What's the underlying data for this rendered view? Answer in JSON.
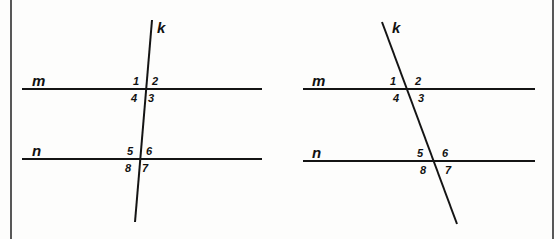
{
  "page": {
    "width": 560,
    "height": 239,
    "background_color": "#fdfdfc",
    "ink_color": "#141414",
    "border_color": "#3a3a3a"
  },
  "borders": {
    "left": {
      "x": 11,
      "y1": 0,
      "y2": 239
    },
    "right": {
      "x": 553,
      "y1": 0,
      "y2": 239
    }
  },
  "figures": [
    {
      "id": "figure-left",
      "name": "near-vertical-transversal",
      "parallel_lines": [
        {
          "label": "m",
          "y": 89,
          "x1": 22,
          "x2": 262,
          "label_x": 32,
          "label_y": 73
        },
        {
          "label": "n",
          "y": 159,
          "x1": 22,
          "x2": 262,
          "label_x": 32,
          "label_y": 143
        }
      ],
      "transversal": {
        "label": "k",
        "x1": 152,
        "y1": 20,
        "x2": 135,
        "y2": 222,
        "label_x": 157,
        "label_y": 20
      },
      "intersections": [
        {
          "line": "m",
          "x": 146,
          "y": 89
        },
        {
          "line": "n",
          "x": 140,
          "y": 159
        }
      ],
      "angles": [
        {
          "number": "1",
          "x": 133,
          "y": 76,
          "position": "upper-left",
          "at": "m"
        },
        {
          "number": "2",
          "x": 152,
          "y": 76,
          "position": "upper-right",
          "at": "m"
        },
        {
          "number": "4",
          "x": 131,
          "y": 93,
          "position": "lower-left",
          "at": "m"
        },
        {
          "number": "3",
          "x": 148,
          "y": 93,
          "position": "lower-right",
          "at": "m"
        },
        {
          "number": "5",
          "x": 127,
          "y": 146,
          "position": "upper-left",
          "at": "n"
        },
        {
          "number": "6",
          "x": 146,
          "y": 146,
          "position": "upper-right",
          "at": "n"
        },
        {
          "number": "8",
          "x": 125,
          "y": 163,
          "position": "lower-left",
          "at": "n"
        },
        {
          "number": "7",
          "x": 142,
          "y": 163,
          "position": "lower-right",
          "at": "n"
        }
      ]
    },
    {
      "id": "figure-right",
      "name": "slanted-transversal",
      "parallel_lines": [
        {
          "label": "m",
          "y": 89,
          "x1": 303,
          "x2": 535,
          "label_x": 312,
          "label_y": 73
        },
        {
          "label": "n",
          "y": 161,
          "x1": 303,
          "x2": 535,
          "label_x": 312,
          "label_y": 145
        }
      ],
      "transversal": {
        "label": "k",
        "x1": 382,
        "y1": 22,
        "x2": 457,
        "y2": 224,
        "label_x": 392,
        "label_y": 20
      },
      "intersections": [
        {
          "line": "m",
          "x": 407,
          "y": 89
        },
        {
          "line": "n",
          "x": 434,
          "y": 161
        }
      ],
      "angles": [
        {
          "number": "1",
          "x": 390,
          "y": 76,
          "position": "upper-left",
          "at": "m"
        },
        {
          "number": "2",
          "x": 415,
          "y": 76,
          "position": "upper-right",
          "at": "m"
        },
        {
          "number": "4",
          "x": 393,
          "y": 93,
          "position": "lower-left",
          "at": "m"
        },
        {
          "number": "3",
          "x": 418,
          "y": 93,
          "position": "lower-right",
          "at": "m"
        },
        {
          "number": "5",
          "x": 417,
          "y": 148,
          "position": "upper-left",
          "at": "n"
        },
        {
          "number": "6",
          "x": 442,
          "y": 148,
          "position": "upper-right",
          "at": "n"
        },
        {
          "number": "8",
          "x": 420,
          "y": 165,
          "position": "lower-left",
          "at": "n"
        },
        {
          "number": "7",
          "x": 445,
          "y": 165,
          "position": "lower-right",
          "at": "n"
        }
      ]
    }
  ]
}
